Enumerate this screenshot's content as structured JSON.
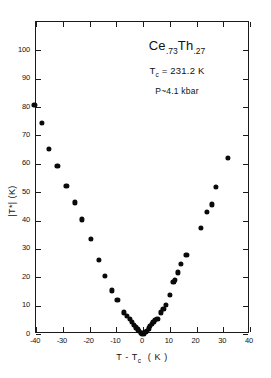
{
  "figure": {
    "background_color": "#ffffff",
    "marker_color": "#0a0a0a",
    "axis_color": "#1a1a1a"
  },
  "annotation": {
    "formula_prefix": "Ce",
    "formula_sub1": ".73",
    "formula_mid": "Th",
    "formula_sub2": ".27",
    "tc_label": "T",
    "tc_sub": "c",
    "tc_value": " = 231.2 K",
    "pressure": "P~4.1 kbar"
  },
  "chart_data": {
    "type": "scatter",
    "title": "",
    "xlabel": "T - Tc  ( K )",
    "ylabel": "|T*| (K)",
    "xlim": [
      -40,
      40
    ],
    "ylim": [
      0,
      110
    ],
    "xticks": [
      -40,
      -30,
      -20,
      -10,
      0,
      10,
      20,
      30,
      40
    ],
    "xticklabels": [
      "-40",
      "-30",
      "-20",
      "-10",
      "0",
      "10",
      "20",
      "30",
      "40"
    ],
    "yticks": [
      0,
      10,
      20,
      30,
      40,
      50,
      60,
      70,
      80,
      90,
      100
    ],
    "yticklabels": [
      "0",
      "10",
      "20",
      "30",
      "40",
      "50",
      "60",
      "70",
      "80",
      "90",
      "100"
    ],
    "grid": false,
    "legend": null,
    "marker": "filled-circle",
    "marker_size_px": 5.2,
    "series": [
      {
        "name": "|T*|",
        "points": [
          [
            -40.6,
            80.8
          ],
          [
            -37.8,
            74.4
          ],
          [
            -35.2,
            65.4
          ],
          [
            -32.0,
            59.2
          ],
          [
            -28.6,
            52.2
          ],
          [
            -25.6,
            46.4
          ],
          [
            -22.8,
            40.4
          ],
          [
            -19.6,
            33.4
          ],
          [
            -16.6,
            26.2
          ],
          [
            -14.2,
            20.6
          ],
          [
            -11.6,
            15.4
          ],
          [
            -9.6,
            12.0
          ],
          [
            -7.0,
            7.6
          ],
          [
            -6.0,
            6.4
          ],
          [
            -5.0,
            5.2
          ],
          [
            -4.2,
            4.3
          ],
          [
            -3.4,
            3.2
          ],
          [
            -2.6,
            2.3
          ],
          [
            -2.0,
            1.6
          ],
          [
            -1.4,
            1.0
          ],
          [
            -0.8,
            0.5
          ],
          [
            -0.3,
            0.2
          ],
          [
            0.3,
            0.2
          ],
          [
            0.9,
            0.6
          ],
          [
            1.5,
            1.2
          ],
          [
            2.1,
            2.0
          ],
          [
            2.7,
            2.9
          ],
          [
            3.3,
            3.7
          ],
          [
            3.9,
            4.4
          ],
          [
            4.6,
            5.0
          ],
          [
            5.4,
            5.4
          ],
          [
            6.6,
            7.6
          ],
          [
            7.6,
            8.8
          ],
          [
            8.6,
            10.2
          ],
          [
            10.2,
            13.8
          ],
          [
            11.4,
            18.4
          ],
          [
            11.8,
            19.0
          ],
          [
            13.0,
            21.7
          ],
          [
            14.2,
            24.8
          ],
          [
            16.2,
            27.8
          ],
          [
            21.6,
            37.4
          ],
          [
            23.8,
            43.0
          ],
          [
            25.8,
            45.7
          ],
          [
            27.4,
            52.0
          ],
          [
            31.8,
            62.0
          ]
        ]
      }
    ]
  }
}
